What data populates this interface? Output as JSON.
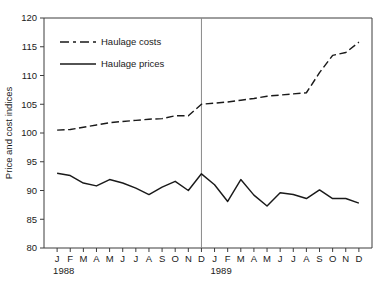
{
  "chart_data": {
    "type": "line",
    "title": "",
    "xlabel": "",
    "ylabel": "Price and cost indices",
    "ylim": [
      80,
      120
    ],
    "yticks": [
      80,
      85,
      90,
      95,
      100,
      105,
      110,
      115,
      120
    ],
    "ytick_labels": [
      "80",
      "85",
      "90",
      "95",
      "100",
      "105",
      "110",
      "115",
      "120"
    ],
    "grid": false,
    "legend_position": "upper-left-inside",
    "x": [
      "1988-01",
      "1988-02",
      "1988-03",
      "1988-04",
      "1988-05",
      "1988-06",
      "1988-07",
      "1988-08",
      "1988-09",
      "1988-10",
      "1988-11",
      "1988-12",
      "1989-01",
      "1989-02",
      "1989-03",
      "1989-04",
      "1989-05",
      "1989-06",
      "1989-07",
      "1989-08",
      "1989-09",
      "1989-10",
      "1989-11",
      "1989-12"
    ],
    "xtick_labels": [
      "J",
      "F",
      "M",
      "A",
      "M",
      "J",
      "J",
      "A",
      "S",
      "O",
      "N",
      "D",
      "J",
      "F",
      "M",
      "A",
      "M",
      "J",
      "J",
      "A",
      "S",
      "O",
      "N",
      "D"
    ],
    "group_labels": [
      {
        "text": "1988",
        "at": "1988-01"
      },
      {
        "text": "1989",
        "at": "1989-01"
      }
    ],
    "annotations": [
      {
        "type": "vertical-divider",
        "at": "1988-12",
        "label": "year boundary"
      }
    ],
    "series": [
      {
        "name": "Haulage costs",
        "style": "dashed",
        "color": "#1a1a1a",
        "values": [
          100.5,
          100.6,
          101.0,
          101.4,
          101.8,
          102.0,
          102.2,
          102.4,
          102.5,
          103.0,
          103.0,
          105.0,
          105.2,
          105.4,
          105.7,
          106.0,
          106.4,
          106.6,
          106.8,
          107.0,
          110.5,
          113.5,
          114.0,
          115.8
        ]
      },
      {
        "name": "Haulage prices",
        "style": "solid",
        "color": "#1a1a1a",
        "values": [
          93.0,
          92.6,
          91.3,
          90.8,
          91.9,
          91.3,
          90.4,
          89.3,
          90.6,
          91.6,
          90.0,
          92.9,
          91.0,
          88.1,
          91.9,
          89.2,
          87.3,
          89.6,
          89.3,
          88.6,
          90.1,
          88.6,
          88.6,
          87.8
        ]
      }
    ],
    "legend": [
      {
        "label": "Haulage costs",
        "style": "dashed"
      },
      {
        "label": "Haulage prices",
        "style": "solid"
      }
    ]
  }
}
